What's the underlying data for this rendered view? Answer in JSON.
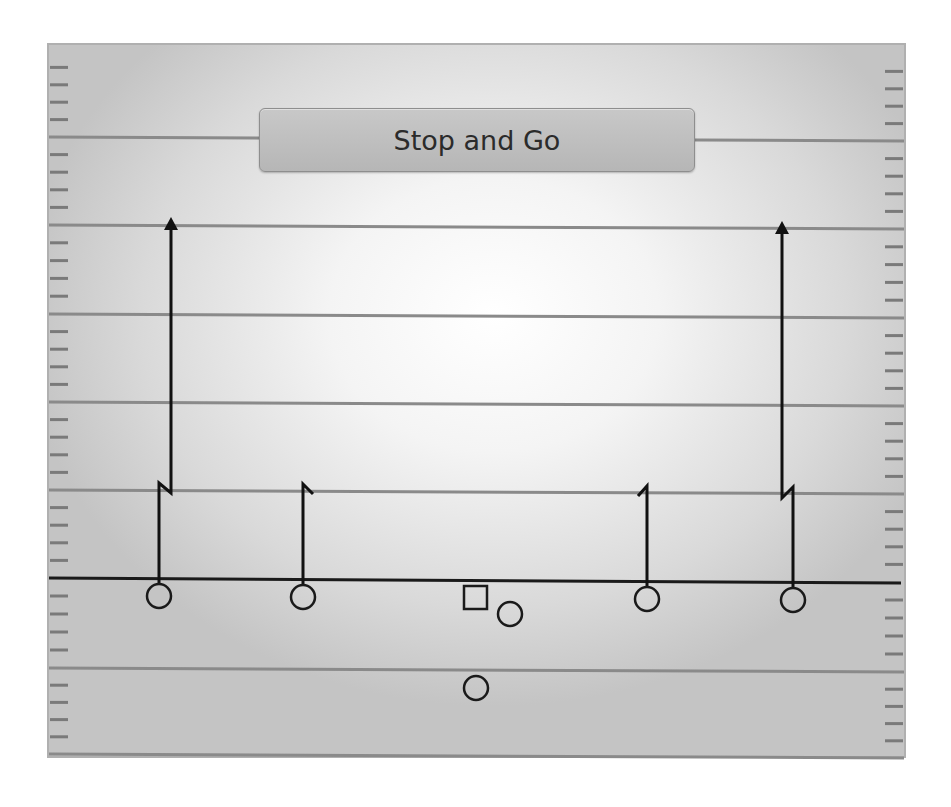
{
  "play": {
    "title": "Stop and Go"
  },
  "colors": {
    "line_of_scrimmage": "#1a1a1a",
    "route": "#111111",
    "yard_line": "#8a8a8a",
    "hash_mark": "#7a7a7a",
    "player_outline": "#1a1a1a",
    "title_box": "#bdbdbd"
  },
  "field": {
    "yard_lines_y": [
      137,
      225,
      314,
      402,
      490,
      668,
      754
    ],
    "line_of_scrimmage_y": 580
  },
  "players": [
    {
      "id": "wr-left-outside",
      "shape": "circle",
      "x": 159,
      "y": 596
    },
    {
      "id": "wr-left-slot",
      "shape": "circle",
      "x": 303,
      "y": 597
    },
    {
      "id": "center",
      "shape": "square",
      "x": 476,
      "y": 598
    },
    {
      "id": "quarterback",
      "shape": "circle",
      "x": 510,
      "y": 614
    },
    {
      "id": "wr-right-slot",
      "shape": "circle",
      "x": 647,
      "y": 599
    },
    {
      "id": "wr-right-outside",
      "shape": "circle",
      "x": 793,
      "y": 600
    },
    {
      "id": "running-back",
      "shape": "circle",
      "x": 476,
      "y": 688
    }
  ],
  "routes": [
    {
      "id": "route-left-outside",
      "type": "stop-and-go",
      "points": "159,584 159,483 171,493 171,230",
      "arrow": {
        "x": 171,
        "y": 217
      }
    },
    {
      "id": "route-left-slot",
      "type": "hitch",
      "points": "303,585 303,484 313,494"
    },
    {
      "id": "route-right-slot",
      "type": "hitch",
      "points": "647,587 647,486 638,496"
    },
    {
      "id": "route-right-outside",
      "type": "stop-and-go",
      "points": "793,588 793,487 782,498 782,234",
      "arrow": {
        "x": 782,
        "y": 221
      }
    }
  ]
}
